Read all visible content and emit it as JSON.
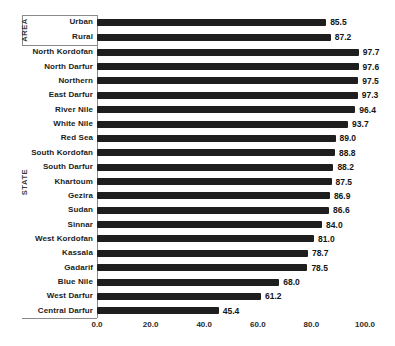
{
  "chart_data": {
    "type": "bar",
    "orientation": "horizontal",
    "title": "",
    "xlabel": "",
    "ylabel": "",
    "xlim": [
      0,
      100
    ],
    "grid": false,
    "legend": "none",
    "bar_color": "#1e1e1e",
    "x_ticks": [
      {
        "value": 0,
        "label": "0.0"
      },
      {
        "value": 20,
        "label": "20.0"
      },
      {
        "value": 40,
        "label": "40.0"
      },
      {
        "value": 60,
        "label": "60.0"
      },
      {
        "value": 80,
        "label": "80.0"
      },
      {
        "value": 100,
        "label": "100.0"
      }
    ],
    "groups": [
      {
        "label": "AREA",
        "rows": [
          {
            "label": "Urban",
            "value": 85.5,
            "value_label": "85.5"
          },
          {
            "label": "Rural",
            "value": 87.2,
            "value_label": "87.2"
          }
        ]
      },
      {
        "label": "STATE",
        "rows": [
          {
            "label": "North Kordofan",
            "value": 97.7,
            "value_label": "97.7"
          },
          {
            "label": "North Darfur",
            "value": 97.6,
            "value_label": "97.6"
          },
          {
            "label": "Northern",
            "value": 97.5,
            "value_label": "97.5"
          },
          {
            "label": "East Darfur",
            "value": 97.3,
            "value_label": "97.3"
          },
          {
            "label": "River Nile",
            "value": 96.4,
            "value_label": "96.4"
          },
          {
            "label": "White Nile",
            "value": 93.7,
            "value_label": "93.7"
          },
          {
            "label": "Red Sea",
            "value": 89.0,
            "value_label": "89.0"
          },
          {
            "label": "South Kordofan",
            "value": 88.8,
            "value_label": "88.8"
          },
          {
            "label": "South Darfur",
            "value": 88.2,
            "value_label": "88.2"
          },
          {
            "label": "Khartoum",
            "value": 87.5,
            "value_label": "87.5"
          },
          {
            "label": "Gezira",
            "value": 86.9,
            "value_label": "86.9"
          },
          {
            "label": "Sudan",
            "value": 86.6,
            "value_label": "86.6"
          },
          {
            "label": "Sinnar",
            "value": 84.0,
            "value_label": "84.0"
          },
          {
            "label": "West Kordofan",
            "value": 81.0,
            "value_label": "81.0"
          },
          {
            "label": "Kassala",
            "value": 78.7,
            "value_label": "78.7"
          },
          {
            "label": "Gadarif",
            "value": 78.5,
            "value_label": "78.5"
          },
          {
            "label": "Blue Nile",
            "value": 68.0,
            "value_label": "68.0"
          },
          {
            "label": "West Darfur",
            "value": 61.2,
            "value_label": "61.2"
          },
          {
            "label": "Central Darfur",
            "value": 45.4,
            "value_label": "45.4"
          }
        ]
      }
    ]
  }
}
